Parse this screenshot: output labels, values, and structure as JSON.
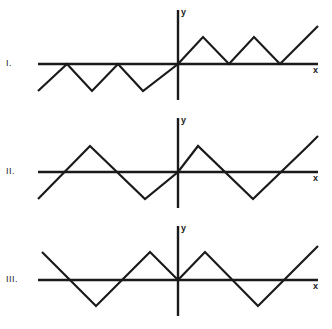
{
  "figure": {
    "background_color": "#ffffff",
    "line_color": "#1a1a1a",
    "panels": [
      {
        "label": "I.",
        "x_axis_label": "x",
        "y_axis_label": "y",
        "description": "Triangle wave tangent to the x-axis; dips below the axis for x<0 and rises above the axis for x>0"
      },
      {
        "label": "II.",
        "x_axis_label": "x",
        "y_axis_label": "y",
        "description": "Triangle wave crossing the x-axis at the origin with positive slope"
      },
      {
        "label": "III.",
        "x_axis_label": "x",
        "y_axis_label": "y",
        "description": "Triangle wave with a local minimum touching the x-axis at the origin"
      }
    ]
  },
  "chart_data": [
    {
      "type": "line",
      "title": "I.",
      "xlabel": "x",
      "ylabel": "y",
      "grid": false,
      "legend": "none",
      "axes": {
        "origin_px": [
          178,
          64
        ],
        "x_axis_px": {
          "x1": 38,
          "x2": 318,
          "y": 64
        },
        "y_axis_px": {
          "x": 178,
          "y1": 10,
          "y2": 100
        }
      },
      "points_px": [
        [
          38,
          91
        ],
        [
          67,
          64
        ],
        [
          92,
          91
        ],
        [
          118,
          64
        ],
        [
          143,
          91
        ],
        [
          178,
          64
        ],
        [
          203,
          37
        ],
        [
          229,
          64
        ],
        [
          254,
          37
        ],
        [
          280,
          64
        ],
        [
          318,
          26
        ]
      ],
      "vertices_note": "Peaks on the left half touch y=0 at x=67 and x=118; on the right half the troughs touch y=0 at x=229 and x=280",
      "half_period_px": 25.5,
      "amplitude_px": 27
    },
    {
      "type": "line",
      "title": "II.",
      "xlabel": "x",
      "ylabel": "y",
      "grid": false,
      "legend": "none",
      "axes": {
        "origin_px": [
          178,
          172
        ],
        "x_axis_px": {
          "x1": 38,
          "x2": 318,
          "y": 172
        },
        "y_axis_px": {
          "x": 178,
          "y1": 118,
          "y2": 208
        }
      },
      "points_px": [
        [
          38,
          199
        ],
        [
          90,
          146
        ],
        [
          145,
          199
        ],
        [
          178,
          172
        ],
        [
          198,
          146
        ],
        [
          253,
          199
        ],
        [
          308,
          146
        ],
        [
          318,
          136
        ]
      ],
      "zero_crossings_px": [
        64,
        118,
        172,
        226,
        280
      ],
      "half_period_px": 54,
      "amplitude_px": 26
    },
    {
      "type": "line",
      "title": "III.",
      "xlabel": "x",
      "ylabel": "y",
      "grid": false,
      "legend": "none",
      "axes": {
        "origin_px": [
          178,
          280
        ],
        "x_axis_px": {
          "x1": 38,
          "x2": 318,
          "y": 280
        },
        "y_axis_px": {
          "x": 178,
          "y1": 226,
          "y2": 316
        }
      },
      "points_px": [
        [
          42,
          252
        ],
        [
          96,
          306
        ],
        [
          150,
          252
        ],
        [
          178,
          280
        ],
        [
          205,
          252
        ],
        [
          258,
          306
        ],
        [
          312,
          252
        ],
        [
          318,
          246
        ]
      ],
      "half_period_px": 54,
      "amplitude_px": 27
    }
  ]
}
